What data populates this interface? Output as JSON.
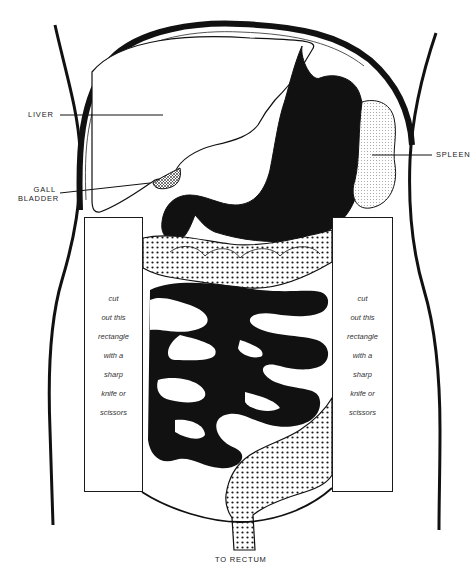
{
  "diagram": {
    "labels": {
      "liver": "LIVER",
      "gall_bladder_line1": "GALL",
      "gall_bladder_line2": "BLADDER",
      "spleen": "SPLEEN",
      "rectum": "TO RECTUM"
    },
    "cut_instructions": {
      "left": [
        "cut",
        "out this",
        "rectangle",
        "with a",
        "sharp",
        "knife or",
        "scissors"
      ],
      "right": [
        "cut",
        "out this",
        "rectangle",
        "with a",
        "sharp",
        "knife or",
        "scissors"
      ]
    },
    "colors": {
      "ink": "#111111",
      "paper": "#ffffff",
      "stipple": "#1a1a1a"
    }
  }
}
